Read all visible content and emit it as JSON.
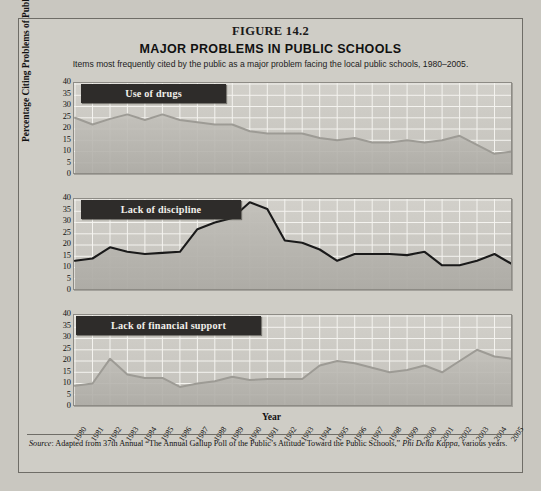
{
  "figure": {
    "number": "FIGURE 14.2",
    "title": "MAJOR PROBLEMS IN PUBLIC SCHOOLS",
    "subtitle": "Items most frequently cited by the public as a major problem facing the local public schools, 1980–2005."
  },
  "axis": {
    "ylabel": "Percentage Citing Problems of Public Schools",
    "xlabel": "Year",
    "yticks": [
      "40",
      "35",
      "30",
      "25",
      "20",
      "15",
      "10",
      "5",
      "0"
    ]
  },
  "source": {
    "prefix": "Source",
    "text": ": Adapted from 37th Annual “The Annual Gallup Poll of the Public’s Attitude Toward the Public Schools,” ",
    "journal": "Phi Delta Kappa",
    "tail": ", various years."
  },
  "colors": {
    "page": "#c9c7c0",
    "figure_bg": "#cfcdc6",
    "tag_bg": "#2e2c2a",
    "tag_text": "#f2f0ea",
    "line_light": "#9d9b95",
    "line_dark": "#1a1a1a",
    "fill_light": "#bcbab4",
    "grid": "#f4f3ef"
  },
  "chart_data": [
    {
      "type": "area",
      "title": "Use of drugs",
      "xlabel": "Year",
      "ylabel": "Percentage Citing Problems of Public Schools",
      "ylim": [
        0,
        40
      ],
      "grid": true,
      "legend": "none",
      "x": [
        "1980",
        "1981",
        "1982",
        "1983",
        "1984",
        "1985",
        "1986",
        "1987",
        "1988",
        "1989",
        "1990",
        "1991",
        "1992",
        "1993",
        "1994",
        "1995",
        "1996",
        "1997",
        "1998",
        "1999",
        "2000",
        "2001",
        "2002",
        "2003",
        "2004",
        "2005"
      ],
      "values": [
        25,
        22,
        24.5,
        26.5,
        24,
        26.5,
        24,
        23,
        22,
        22,
        19,
        18,
        18,
        18,
        16,
        15,
        16,
        14,
        14,
        15,
        14,
        15,
        17,
        13,
        9,
        10
      ]
    },
    {
      "type": "line",
      "title": "Lack of discipline",
      "xlabel": "Year",
      "ylabel": "Percentage Citing Problems of Public Schools",
      "ylim": [
        0,
        40
      ],
      "grid": true,
      "legend": "none",
      "x": [
        "1980",
        "1981",
        "1982",
        "1983",
        "1984",
        "1985",
        "1986",
        "1987",
        "1988",
        "1989",
        "1990",
        "1991",
        "1992",
        "1993",
        "1994",
        "1995",
        "1996",
        "1997",
        "1998",
        "1999",
        "2000",
        "2001",
        "2002",
        "2003",
        "2004",
        "2005"
      ],
      "values": [
        13,
        14,
        19,
        17,
        16,
        16.5,
        17,
        27,
        30,
        32,
        39,
        36,
        22,
        21,
        18,
        13,
        16,
        16,
        16,
        15.5,
        17,
        11,
        11,
        13,
        16,
        11.5
      ]
    },
    {
      "type": "area",
      "title": "Lack of financial support",
      "xlabel": "Year",
      "ylabel": "Percentage Citing Problems of Public Schools",
      "ylim": [
        0,
        40
      ],
      "grid": true,
      "legend": "none",
      "x": [
        "1980",
        "1981",
        "1982",
        "1983",
        "1984",
        "1985",
        "1986",
        "1987",
        "1988",
        "1989",
        "1990",
        "1991",
        "1992",
        "1993",
        "1994",
        "1995",
        "1996",
        "1997",
        "1998",
        "1999",
        "2000",
        "2001",
        "2002",
        "2003",
        "2004",
        "2005"
      ],
      "values": [
        9,
        10,
        21,
        14,
        12.5,
        12.5,
        8.5,
        10,
        11,
        13,
        11.5,
        12,
        12,
        12,
        18,
        20,
        19,
        17,
        15,
        16,
        18,
        15,
        20,
        25,
        22,
        21
      ]
    }
  ]
}
